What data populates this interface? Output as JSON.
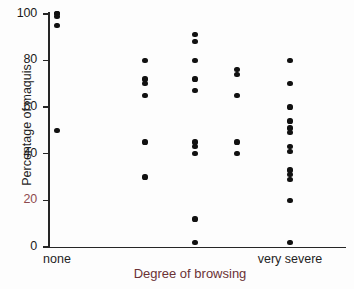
{
  "chart_data": {
    "type": "scatter",
    "title": "",
    "xlabel": "Degree of browsing",
    "ylabel": "Percentage of maquis",
    "ylim": [
      0,
      100
    ],
    "yticks": [
      0,
      20,
      40,
      60,
      80,
      100
    ],
    "ytick_labels": [
      "0",
      "20",
      "40",
      "60",
      "80",
      "100"
    ],
    "xlim": [
      0,
      6
    ],
    "xtick_labels": [
      "none",
      "very severe"
    ],
    "xtick_positions": [
      1,
      5
    ],
    "grid": false,
    "legend": null,
    "categories": [
      "none",
      "",
      "",
      "",
      "very severe"
    ],
    "series": [
      {
        "name": "maquis percentage",
        "points": [
          {
            "x": 1,
            "y": 100
          },
          {
            "x": 1,
            "y": 100
          },
          {
            "x": 1,
            "y": 99
          },
          {
            "x": 1,
            "y": 95
          },
          {
            "x": 1,
            "y": 50
          },
          {
            "x": 2,
            "y": 80
          },
          {
            "x": 2,
            "y": 72
          },
          {
            "x": 2,
            "y": 70
          },
          {
            "x": 2,
            "y": 65
          },
          {
            "x": 2,
            "y": 45
          },
          {
            "x": 2,
            "y": 30
          },
          {
            "x": 3,
            "y": 91
          },
          {
            "x": 3,
            "y": 88
          },
          {
            "x": 3,
            "y": 80
          },
          {
            "x": 3,
            "y": 72
          },
          {
            "x": 3,
            "y": 67
          },
          {
            "x": 3,
            "y": 45
          },
          {
            "x": 3,
            "y": 43
          },
          {
            "x": 3,
            "y": 40
          },
          {
            "x": 3,
            "y": 12
          },
          {
            "x": 3,
            "y": 2
          },
          {
            "x": 4,
            "y": 76
          },
          {
            "x": 4,
            "y": 74
          },
          {
            "x": 4,
            "y": 65
          },
          {
            "x": 4,
            "y": 45
          },
          {
            "x": 4,
            "y": 40
          },
          {
            "x": 5,
            "y": 80
          },
          {
            "x": 5,
            "y": 70
          },
          {
            "x": 5,
            "y": 60
          },
          {
            "x": 5,
            "y": 54
          },
          {
            "x": 5,
            "y": 51
          },
          {
            "x": 5,
            "y": 49
          },
          {
            "x": 5,
            "y": 43
          },
          {
            "x": 5,
            "y": 41
          },
          {
            "x": 5,
            "y": 33
          },
          {
            "x": 5,
            "y": 31
          },
          {
            "x": 5,
            "y": 29
          },
          {
            "x": 5,
            "y": 20
          },
          {
            "x": 5,
            "y": 2
          }
        ]
      }
    ]
  }
}
